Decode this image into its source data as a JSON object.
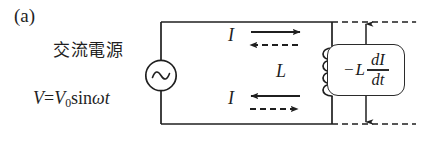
{
  "figure": {
    "panel_label": "(a)",
    "background_color": "#ffffff",
    "ink_color": "#1f1f1f"
  },
  "source": {
    "name": "交流電源",
    "name_meaning": "AC power source",
    "symbol_icon": "ac-source-sine-icon",
    "equation": {
      "lhs": "V",
      "equals": "=",
      "amplitude": "V",
      "amplitude_subscript": "0",
      "function": "sin",
      "angular_frequency": "ω",
      "time": "t",
      "full_text": "V=V0sinωt"
    }
  },
  "current": {
    "top_label": "I",
    "bottom_label": "I",
    "top_solid_arrow_direction": "right",
    "top_dashed_arrow_direction": "left",
    "bottom_solid_arrow_direction": "left",
    "bottom_dashed_arrow_direction": "right"
  },
  "inductor": {
    "label": "L",
    "symbol_icon": "inductor-coil-icon",
    "turns": 4
  },
  "emf": {
    "minus_sign": "−",
    "inductance": "L",
    "numerator": "dI",
    "denominator": "dt",
    "full_text": "-L dI/dt",
    "top_arrow_direction": "up",
    "bottom_arrow_direction": "down"
  }
}
